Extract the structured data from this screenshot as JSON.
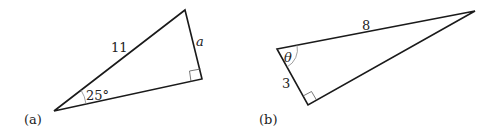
{
  "figure_a": {
    "caption": "(a)",
    "hypotenuse_label": "11",
    "opposite_label": "a",
    "angle_label": "25°",
    "right_angle": true
  },
  "figure_b": {
    "caption": "(b)",
    "hypotenuse_label": "8",
    "adjacent_label": "3",
    "angle_label": "θ",
    "right_angle": true
  },
  "colors": {
    "stroke": "#1a1a1a",
    "text": "#222222",
    "angle_arc": "#888888"
  }
}
